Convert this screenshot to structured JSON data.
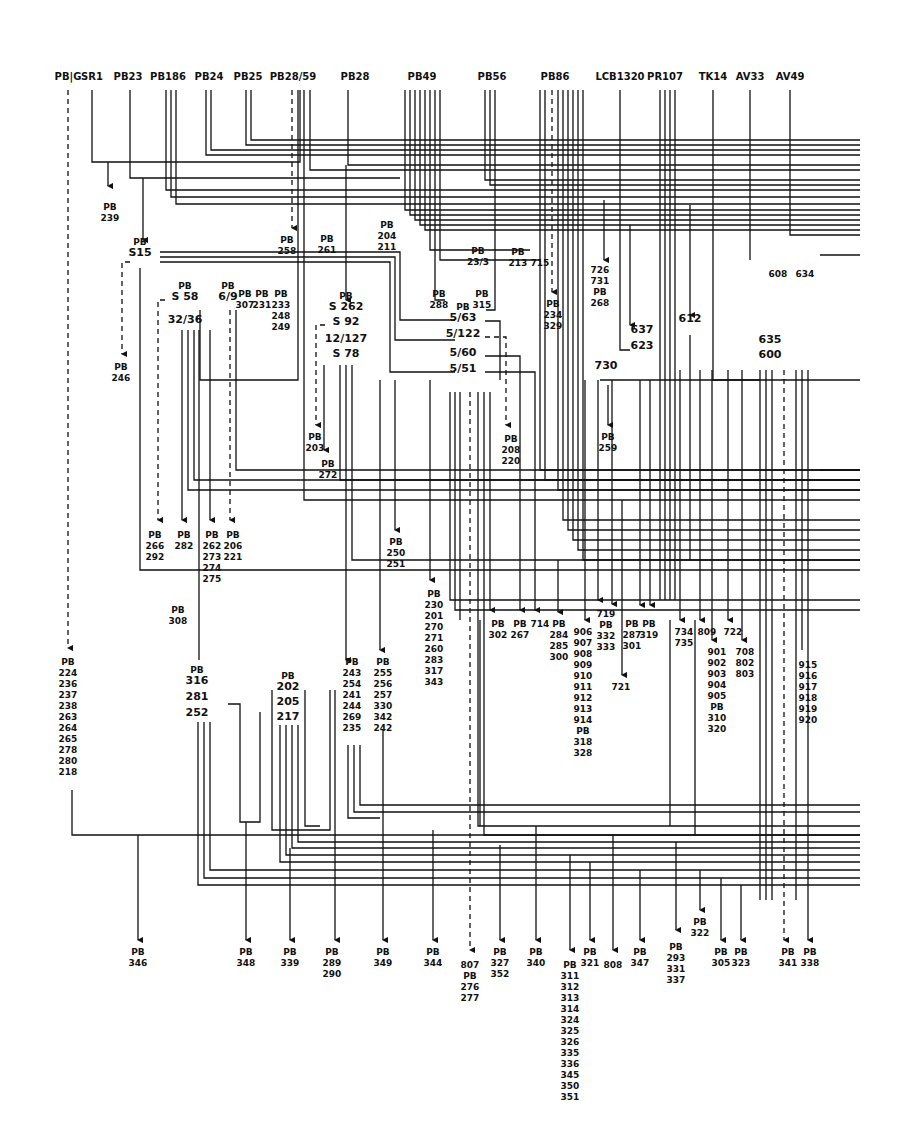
{
  "diagram": {
    "colors": {
      "ink": "#111111",
      "paper": "#ffffff"
    },
    "sources": [
      {
        "label": "PB|G",
        "x": 68
      },
      {
        "label": "SR1",
        "x": 92
      },
      {
        "label": "PB23",
        "x": 128
      },
      {
        "label": "PB186",
        "x": 168
      },
      {
        "label": "PB24",
        "x": 209
      },
      {
        "label": "PB25",
        "x": 248
      },
      {
        "label": "PB28/59",
        "x": 293
      },
      {
        "label": "PB28",
        "x": 355
      },
      {
        "label": "PB49",
        "x": 422
      },
      {
        "label": "PB56",
        "x": 492
      },
      {
        "label": "PB86",
        "x": 555
      },
      {
        "label": "LCB1320",
        "x": 620
      },
      {
        "label": "PR107",
        "x": 665
      },
      {
        "label": "TK14",
        "x": 713
      },
      {
        "label": "AV33",
        "x": 750
      },
      {
        "label": "AV49",
        "x": 790
      }
    ],
    "nodes": [
      {
        "id": "S15",
        "label": "S15",
        "prefix": "PB",
        "x": 140,
        "y": 256
      },
      {
        "id": "S58",
        "label": "S 58",
        "prefix": "PB",
        "x": 185,
        "y": 300
      },
      {
        "id": "32_36",
        "label": "32/36",
        "x": 185,
        "y": 323
      },
      {
        "id": "6_9",
        "label": "6/9",
        "prefix": "PB",
        "x": 228,
        "y": 300
      },
      {
        "id": "S262",
        "label": "S 262",
        "prefix": "PB",
        "x": 346,
        "y": 310
      },
      {
        "id": "S92",
        "label": "S 92",
        "x": 346,
        "y": 325
      },
      {
        "id": "12_127",
        "label": "12/127",
        "x": 346,
        "y": 342
      },
      {
        "id": "S78",
        "label": "S 78",
        "x": 346,
        "y": 357
      },
      {
        "id": "5_63",
        "label": "5/63",
        "prefix": "PB",
        "x": 463,
        "y": 321
      },
      {
        "id": "5_122",
        "label": "5/122",
        "x": 463,
        "y": 337
      },
      {
        "id": "5_60",
        "label": "5/60",
        "x": 463,
        "y": 356
      },
      {
        "id": "5_51",
        "label": "5/51",
        "x": 463,
        "y": 372
      },
      {
        "id": "637",
        "label": "637",
        "x": 642,
        "y": 333
      },
      {
        "id": "623",
        "label": "623",
        "x": 642,
        "y": 349
      },
      {
        "id": "730",
        "label": "730",
        "x": 606,
        "y": 369
      },
      {
        "id": "612",
        "label": "612",
        "x": 690,
        "y": 322
      },
      {
        "id": "635",
        "label": "635",
        "x": 770,
        "y": 343
      },
      {
        "id": "600",
        "label": "600",
        "x": 770,
        "y": 358
      },
      {
        "id": "202",
        "label": "202",
        "prefix": "PB",
        "x": 288,
        "y": 690
      },
      {
        "id": "205",
        "label": "205",
        "x": 288,
        "y": 705
      },
      {
        "id": "217",
        "label": "217",
        "x": 288,
        "y": 720
      },
      {
        "id": "316",
        "label": "316",
        "prefix": "PB",
        "x": 197,
        "y": 684
      },
      {
        "id": "281",
        "label": "281",
        "x": 197,
        "y": 700
      },
      {
        "id": "252",
        "label": "252",
        "x": 197,
        "y": 716
      }
    ],
    "destinations_upper": [
      {
        "lines": [
          "PB",
          "239"
        ],
        "x": 110,
        "y": 200
      },
      {
        "lines": [
          "PB",
          "258"
        ],
        "x": 287,
        "y": 233
      },
      {
        "lines": [
          "PB",
          "261"
        ],
        "x": 327,
        "y": 232
      },
      {
        "lines": [
          "PB",
          "204",
          "211"
        ],
        "x": 387,
        "y": 218
      },
      {
        "lines": [
          "PB",
          "23/3"
        ],
        "x": 478,
        "y": 244
      },
      {
        "lines": [
          "PB",
          "213"
        ],
        "x": 518,
        "y": 245
      },
      {
        "lines": [
          "715"
        ],
        "x": 540,
        "y": 256
      },
      {
        "lines": [
          "726",
          "731",
          "PB",
          "268"
        ],
        "x": 600,
        "y": 263
      },
      {
        "lines": [
          "608"
        ],
        "x": 778,
        "y": 267
      },
      {
        "lines": [
          "634"
        ],
        "x": 805,
        "y": 267
      },
      {
        "lines": [
          "PB",
          "246"
        ],
        "x": 121,
        "y": 360
      },
      {
        "lines": [
          "PB",
          "233",
          "248",
          "249"
        ],
        "x": 281,
        "y": 287
      },
      {
        "lines": [
          "PB",
          "231"
        ],
        "x": 262,
        "y": 287
      },
      {
        "lines": [
          "PB",
          "307"
        ],
        "x": 245,
        "y": 287
      },
      {
        "lines": [
          "PB",
          "288"
        ],
        "x": 439,
        "y": 287
      },
      {
        "lines": [
          "PB",
          "315"
        ],
        "x": 482,
        "y": 287
      },
      {
        "lines": [
          "PB",
          "234",
          "329"
        ],
        "x": 553,
        "y": 297
      },
      {
        "lines": [
          "PB",
          "203"
        ],
        "x": 315,
        "y": 430
      },
      {
        "lines": [
          "PB",
          "272"
        ],
        "x": 328,
        "y": 457
      },
      {
        "lines": [
          "PB",
          "208",
          "220"
        ],
        "x": 511,
        "y": 432
      },
      {
        "lines": [
          "PB",
          "259"
        ],
        "x": 608,
        "y": 430
      }
    ],
    "destinations_middle": [
      {
        "lines": [
          "PB",
          "266",
          "292"
        ],
        "x": 155,
        "y": 528
      },
      {
        "lines": [
          "PB",
          "282"
        ],
        "x": 184,
        "y": 528
      },
      {
        "lines": [
          "PB",
          "262",
          "273",
          "274",
          "275"
        ],
        "x": 212,
        "y": 528
      },
      {
        "lines": [
          "PB",
          "206",
          "221"
        ],
        "x": 233,
        "y": 528
      },
      {
        "lines": [
          "PB",
          "308"
        ],
        "x": 178,
        "y": 603
      },
      {
        "lines": [
          "PB",
          "250",
          "251"
        ],
        "x": 396,
        "y": 535
      },
      {
        "lines": [
          "PB",
          "230",
          "201",
          "270",
          "271",
          "260",
          "283",
          "317",
          "343"
        ],
        "x": 434,
        "y": 587
      },
      {
        "lines": [
          "PB",
          "302"
        ],
        "x": 498,
        "y": 617
      },
      {
        "lines": [
          "PB",
          "267"
        ],
        "x": 520,
        "y": 617
      },
      {
        "lines": [
          "714"
        ],
        "x": 540,
        "y": 617
      },
      {
        "lines": [
          "PB",
          "284",
          "285",
          "300"
        ],
        "x": 559,
        "y": 617
      },
      {
        "lines": [
          "906",
          "907",
          "908",
          "909",
          "910",
          "911",
          "912",
          "913",
          "914",
          "PB",
          "318",
          "328"
        ],
        "x": 583,
        "y": 625
      },
      {
        "lines": [
          "719",
          "PB",
          "332",
          "333"
        ],
        "x": 606,
        "y": 607
      },
      {
        "lines": [
          "PB",
          "287",
          "301"
        ],
        "x": 632,
        "y": 617
      },
      {
        "lines": [
          "PB",
          "319"
        ],
        "x": 649,
        "y": 617
      },
      {
        "lines": [
          "721"
        ],
        "x": 621,
        "y": 680
      },
      {
        "lines": [
          "734",
          "735"
        ],
        "x": 684,
        "y": 625
      },
      {
        "lines": [
          "809"
        ],
        "x": 707,
        "y": 625
      },
      {
        "lines": [
          "722"
        ],
        "x": 733,
        "y": 625
      },
      {
        "lines": [
          "901",
          "902",
          "903",
          "904",
          "905",
          "PB",
          "310",
          "320"
        ],
        "x": 717,
        "y": 645
      },
      {
        "lines": [
          "708",
          "802",
          "803"
        ],
        "x": 745,
        "y": 645
      },
      {
        "lines": [
          "915",
          "916",
          "917",
          "918",
          "919",
          "920"
        ],
        "x": 808,
        "y": 658
      }
    ],
    "destinations_left_column": [
      {
        "lines": [
          "PB",
          "224",
          "236",
          "237",
          "238",
          "263",
          "264",
          "265",
          "278",
          "280",
          "218"
        ],
        "x": 68,
        "y": 655
      }
    ],
    "destinations_bundles": [
      {
        "lines": [
          "PB",
          "243",
          "254",
          "241",
          "244",
          "269",
          "235"
        ],
        "x": 352,
        "y": 655
      },
      {
        "lines": [
          "PB",
          "255",
          "256",
          "257",
          "330",
          "342",
          "242"
        ],
        "x": 383,
        "y": 655
      }
    ],
    "destinations_bottom": [
      {
        "lines": [
          "PB",
          "346"
        ],
        "x": 138,
        "y": 945
      },
      {
        "lines": [
          "PB",
          "348"
        ],
        "x": 246,
        "y": 945
      },
      {
        "lines": [
          "PB",
          "339"
        ],
        "x": 290,
        "y": 945
      },
      {
        "lines": [
          "PB",
          "289",
          "290"
        ],
        "x": 332,
        "y": 945
      },
      {
        "lines": [
          "PB",
          "349"
        ],
        "x": 383,
        "y": 945
      },
      {
        "lines": [
          "PB",
          "344"
        ],
        "x": 433,
        "y": 945
      },
      {
        "lines": [
          "807",
          "PB",
          "276",
          "277"
        ],
        "x": 470,
        "y": 958
      },
      {
        "lines": [
          "PB",
          "327",
          "352"
        ],
        "x": 500,
        "y": 945
      },
      {
        "lines": [
          "PB",
          "340"
        ],
        "x": 536,
        "y": 945
      },
      {
        "lines": [
          "PB",
          "311",
          "312",
          "313",
          "314",
          "324",
          "325",
          "326",
          "335",
          "336",
          "345",
          "350",
          "351"
        ],
        "x": 570,
        "y": 958
      },
      {
        "lines": [
          "PB",
          "321"
        ],
        "x": 590,
        "y": 945
      },
      {
        "lines": [
          "808"
        ],
        "x": 613,
        "y": 958
      },
      {
        "lines": [
          "PB",
          "347"
        ],
        "x": 640,
        "y": 945
      },
      {
        "lines": [
          "PB",
          "293",
          "331",
          "337"
        ],
        "x": 676,
        "y": 940
      },
      {
        "lines": [
          "PB",
          "322"
        ],
        "x": 700,
        "y": 915
      },
      {
        "lines": [
          "PB",
          "305"
        ],
        "x": 721,
        "y": 945
      },
      {
        "lines": [
          "PB",
          "323"
        ],
        "x": 741,
        "y": 945
      },
      {
        "lines": [
          "PB",
          "341"
        ],
        "x": 788,
        "y": 945
      },
      {
        "lines": [
          "PB",
          "338"
        ],
        "x": 810,
        "y": 945
      }
    ]
  }
}
